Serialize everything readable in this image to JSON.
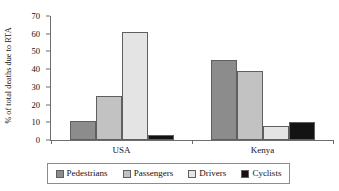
{
  "chart_data": {
    "type": "bar",
    "title": "",
    "xlabel": "",
    "ylabel": "% of total deaths due to RTA",
    "categories": [
      "USA",
      "Kenya"
    ],
    "series": [
      {
        "name": "Pedestrians",
        "values": [
          11,
          45
        ],
        "color": "#8c8c8c"
      },
      {
        "name": "Passengers",
        "values": [
          25,
          39
        ],
        "color": "#c2c2c2"
      },
      {
        "name": "Drivers",
        "values": [
          61,
          8
        ],
        "color": "#e4e4e4"
      },
      {
        "name": "Cyclists",
        "values": [
          3,
          10
        ],
        "color": "#131313"
      }
    ],
    "ylim": [
      0,
      70
    ],
    "yticks": [
      0,
      10,
      20,
      30,
      40,
      50,
      60,
      70
    ],
    "ytick_labels": [
      "0",
      "10",
      "20",
      "30",
      "40",
      "50",
      "60",
      "70"
    ],
    "grid": false,
    "legend_position": "bottom"
  },
  "axis": {
    "y_title": "% of total deaths due to RTA"
  },
  "legend": {
    "items": [
      {
        "label": "Pedestrians"
      },
      {
        "label": "Passengers"
      },
      {
        "label": "Drivers"
      },
      {
        "label": "Cyclists"
      }
    ]
  },
  "colors": {
    "pedestrians": "#8c8c8c",
    "passengers": "#c2c2c2",
    "drivers": "#e4e4e4",
    "cyclists": "#131313",
    "axis": "#6d6d6d",
    "bar_outline": "#5f5f5f",
    "background": "#ffffff"
  }
}
